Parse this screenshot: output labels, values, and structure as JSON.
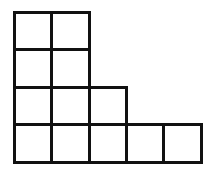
{
  "diagram": {
    "type": "young-diagram",
    "rows_top_to_bottom": [
      2,
      2,
      3,
      5
    ],
    "origin": {
      "x": 15,
      "y": 13
    },
    "cell_size": 37.2,
    "line_width": 3.5,
    "line_color": "#111111",
    "background": "#ffffff"
  }
}
